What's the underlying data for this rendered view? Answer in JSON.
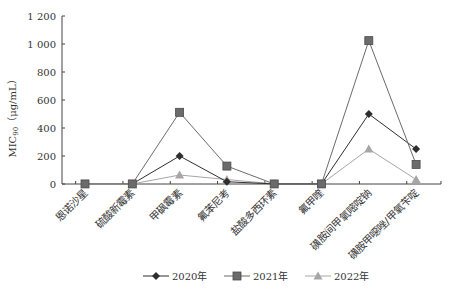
{
  "chart_data": {
    "type": "line",
    "title": "",
    "xlabel": "",
    "ylabel": "MIC90（μg/mL）",
    "ylabel_main": "MIC",
    "ylabel_sub": "90",
    "ylabel_unit": "（μg/mL）",
    "ylim": [
      0,
      1200
    ],
    "yticks": [
      0,
      200,
      400,
      600,
      800,
      1000,
      1200
    ],
    "ytick_labels": [
      "0",
      "200",
      "400",
      "600",
      "800",
      "1 000",
      "1 200"
    ],
    "grid": false,
    "legend_position": "bottom",
    "categories": [
      "恩诺沙星",
      "硫酸新霉素",
      "甲砜霉素",
      "氟苯尼考",
      "盐酸多西环素",
      "氟甲喹",
      "磺胺间甲氧嘧啶钠",
      "磺胺甲噁唑/甲氧苄啶"
    ],
    "series": [
      {
        "name": "2020年",
        "marker": "diamond",
        "color": "#2e2e2e",
        "values": [
          null,
          0.5,
          200,
          16,
          0.5,
          0.5,
          500,
          250
        ]
      },
      {
        "name": "2021年",
        "marker": "square",
        "color": "#6b6b6b",
        "values": [
          0.5,
          0.5,
          512,
          128,
          0.5,
          0.5,
          1024,
          140
        ]
      },
      {
        "name": "2022年",
        "marker": "triangle",
        "color": "#a6a6a6",
        "values": [
          null,
          0.5,
          64,
          32,
          0.5,
          0.5,
          250,
          32
        ]
      }
    ]
  }
}
